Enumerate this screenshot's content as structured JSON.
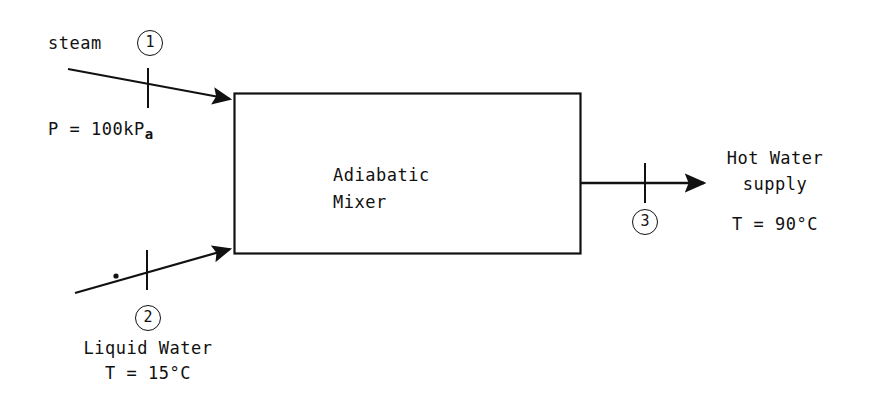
{
  "diagram": {
    "background_color": "#ffffff",
    "line_color": "#111111"
  },
  "unit": {
    "name_line1": "Adiabatic",
    "name_line2": "Mixer",
    "shape": "rectangle",
    "x": 234,
    "y": 93,
    "width": 346,
    "height": 160
  },
  "streams": [
    {
      "id": "1",
      "marker": "1",
      "name": "steam",
      "direction": "inlet",
      "property_label": "P = 100kP",
      "property_subscript": "a",
      "arrow": {
        "x1": 68,
        "y1": 69,
        "x2": 232,
        "y2": 100
      },
      "tick": {
        "x": 148,
        "y": 88
      }
    },
    {
      "id": "2",
      "marker": "2",
      "name_line1": "Liquid Water",
      "name_line2": "T = 15°C",
      "direction": "inlet",
      "arrow": {
        "x1": 75,
        "y1": 293,
        "x2": 232,
        "y2": 248
      },
      "tick": {
        "x": 147,
        "y": 270
      },
      "dot": {
        "x": 115,
        "y": 276
      }
    },
    {
      "id": "3",
      "marker": "3",
      "name_line1": "Hot Water",
      "name_line2": "supply",
      "name_line3": "T = 90°C",
      "direction": "outlet",
      "arrow": {
        "x1": 580,
        "y1": 183,
        "x2": 710,
        "y2": 183
      },
      "tick": {
        "x": 645,
        "y": 183
      }
    }
  ],
  "labels": {
    "steam": "steam",
    "pressure": "P = 100kP",
    "pressure_subscript": "a",
    "liquid_water": "Liquid Water",
    "liquid_water_temp": "T = 15°C",
    "hot_water": "Hot Water",
    "hot_water_supply": "supply",
    "hot_water_temp": "T = 90°C",
    "mixer_line1": "Adiabatic",
    "mixer_line2": "Mixer",
    "marker_1": "1",
    "marker_2": "2",
    "marker_3": "3"
  }
}
